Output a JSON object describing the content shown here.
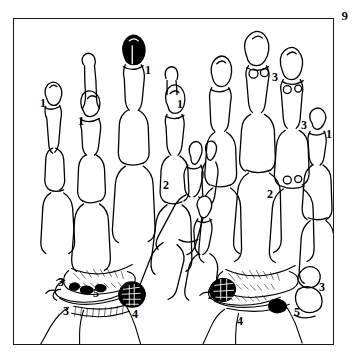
{
  "figure": {
    "plate_number": "9",
    "caption": "",
    "background_color": "#ffffff",
    "ink_color": "#000000",
    "frame_color": "#1a1a1a"
  },
  "illustration": {
    "title": "",
    "subject": "skeletal hands line drawing",
    "specimens": [
      {
        "name": "left-hand-skeleton",
        "side": "left"
      },
      {
        "name": "right-hand-skeleton",
        "side": "right"
      }
    ]
  },
  "callouts": [
    {
      "id": "c1",
      "text": "1",
      "x": 26,
      "y": 78,
      "hand": "left"
    },
    {
      "id": "c2",
      "text": "1",
      "x": 64,
      "y": 96,
      "hand": "left"
    },
    {
      "id": "c3",
      "text": "1",
      "x": 131,
      "y": 45,
      "hand": "left"
    },
    {
      "id": "c4",
      "text": "1",
      "x": 163,
      "y": 79,
      "hand": "left"
    },
    {
      "id": "c5",
      "text": "2",
      "x": 149,
      "y": 160,
      "hand": "left"
    },
    {
      "id": "c6",
      "text": "3",
      "x": 44,
      "y": 257,
      "hand": "left"
    },
    {
      "id": "c7",
      "text": "5",
      "x": 79,
      "y": 268,
      "hand": "left"
    },
    {
      "id": "c8",
      "text": "3",
      "x": 49,
      "y": 286,
      "hand": "left"
    },
    {
      "id": "c9",
      "text": "4",
      "x": 118,
      "y": 289,
      "hand": "left"
    },
    {
      "id": "c10",
      "text": "3",
      "x": 258,
      "y": 52,
      "hand": "right"
    },
    {
      "id": "c11",
      "text": "3",
      "x": 287,
      "y": 100,
      "hand": "right"
    },
    {
      "id": "c12",
      "text": "1",
      "x": 312,
      "y": 109,
      "hand": "right"
    },
    {
      "id": "c13",
      "text": "2",
      "x": 253,
      "y": 169,
      "hand": "right"
    },
    {
      "id": "c14",
      "text": "3",
      "x": 305,
      "y": 262,
      "hand": "right"
    },
    {
      "id": "c15",
      "text": "5",
      "x": 280,
      "y": 287,
      "hand": "right"
    },
    {
      "id": "c16",
      "text": "4",
      "x": 223,
      "y": 296,
      "hand": "right"
    }
  ]
}
